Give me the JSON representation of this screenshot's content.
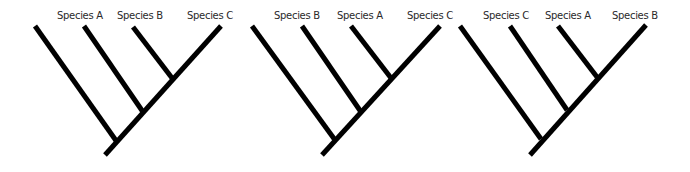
{
  "diagram": {
    "type": "cladograms",
    "line_color": "#000000",
    "background": "#ffffff",
    "trees": [
      {
        "labels": [
          "Species A",
          "Species B",
          "Species C"
        ],
        "label_x": [
          57,
          117,
          187
        ],
        "root": [
          105,
          155
        ],
        "trunk_top": [
          221,
          26
        ],
        "branches": [
          {
            "from": [
              35,
              26
            ],
            "to": [
              117,
              142
            ]
          },
          {
            "from": [
              84,
              26
            ],
            "to": [
              143,
              112
            ]
          },
          {
            "from": [
              133,
              27
            ],
            "to": [
              172,
              78
            ]
          }
        ]
      },
      {
        "labels": [
          "Species B",
          "Species A",
          "Species C"
        ],
        "label_x": [
          274,
          337,
          407
        ],
        "root": [
          322,
          155
        ],
        "trunk_top": [
          440,
          26
        ],
        "branches": [
          {
            "from": [
              252,
              26
            ],
            "to": [
              335,
              140
            ]
          },
          {
            "from": [
              302,
              26
            ],
            "to": [
              361,
              112
            ]
          },
          {
            "from": [
              351,
              26
            ],
            "to": [
              391,
              78
            ]
          }
        ]
      },
      {
        "labels": [
          "Species C",
          "Species A",
          "Species B"
        ],
        "label_x": [
          483,
          545,
          612
        ],
        "root": [
          530,
          155
        ],
        "trunk_top": [
          646,
          25
        ],
        "branches": [
          {
            "from": [
              460,
              26
            ],
            "to": [
              541,
              139
            ]
          },
          {
            "from": [
              510,
              26
            ],
            "to": [
              567,
              110
            ]
          },
          {
            "from": [
              558,
              26
            ],
            "to": [
              597,
              77
            ]
          }
        ]
      }
    ]
  }
}
